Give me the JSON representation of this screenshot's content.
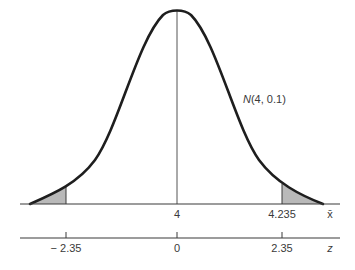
{
  "diagram": {
    "type": "normal-distribution-two-tailed",
    "curve_label_prefix": "N",
    "curve_label_args": "(4, 0.1)",
    "x_axis": {
      "variable": "x̄",
      "ticks": [
        {
          "label": "4",
          "position": "center"
        },
        {
          "label": "4.235",
          "position": "right-critical"
        }
      ]
    },
    "z_axis": {
      "variable": "z",
      "ticks": [
        {
          "label": "− 2.35",
          "position": "left-critical"
        },
        {
          "label": "0",
          "position": "center"
        },
        {
          "label": "2.35",
          "position": "right-critical"
        }
      ]
    },
    "shaded_regions": [
      "left-tail",
      "right-tail"
    ],
    "colors": {
      "curve": "#1e1e1e",
      "axis": "#3a3a3a",
      "shade": "#b9b9b9",
      "center_line": "#555555"
    }
  }
}
